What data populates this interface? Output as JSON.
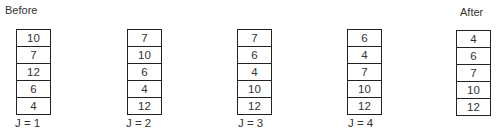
{
  "headings": {
    "before": "Before",
    "after": "After"
  },
  "stacks": [
    {
      "label": "J = 1",
      "values": [
        "10",
        "7",
        "12",
        "6",
        "4"
      ]
    },
    {
      "label": "J = 2",
      "values": [
        "7",
        "10",
        "6",
        "4",
        "12"
      ]
    },
    {
      "label": "J = 3",
      "values": [
        "7",
        "6",
        "4",
        "10",
        "12"
      ]
    },
    {
      "label": "J = 4",
      "values": [
        "6",
        "4",
        "7",
        "10",
        "12"
      ]
    },
    {
      "label": "",
      "values": [
        "4",
        "6",
        "7",
        "10",
        "12"
      ]
    }
  ]
}
